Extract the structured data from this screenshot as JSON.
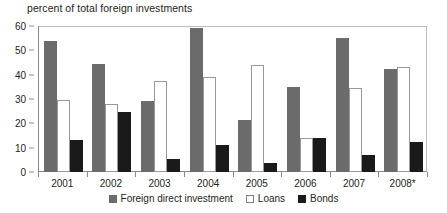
{
  "chart_data": {
    "type": "bar",
    "title": "percent of total foreign investments",
    "xlabel": "",
    "ylabel": "",
    "ylim": [
      0,
      60
    ],
    "yticks": [
      0,
      10,
      20,
      30,
      40,
      50,
      60
    ],
    "grid": false,
    "legend_position": "bottom",
    "categories": [
      "2001",
      "2002",
      "2003",
      "2004",
      "2005",
      "2006",
      "2007",
      "2008*"
    ],
    "series": [
      {
        "name": "Foreign direct investment",
        "color": "#6b6b6b",
        "values": [
          54,
          44.5,
          29,
          59,
          21.5,
          35,
          55,
          42.5
        ]
      },
      {
        "name": "Loans",
        "color": "#ffffff",
        "values": [
          29.5,
          28,
          37.5,
          39,
          44,
          14,
          34.5,
          43
        ]
      },
      {
        "name": "Bonds",
        "color": "#1a1a1a",
        "values": [
          13,
          24.5,
          5.5,
          11,
          3.5,
          14,
          7,
          12.5
        ]
      }
    ],
    "footnote_marker": "*"
  },
  "legend": {
    "items": [
      {
        "label": "Foreign direct investment",
        "swatch": "filled-gray-square-icon"
      },
      {
        "label": "Loans",
        "swatch": "outlined-white-square-icon"
      },
      {
        "label": "Bonds",
        "swatch": "filled-black-square-icon"
      }
    ]
  }
}
